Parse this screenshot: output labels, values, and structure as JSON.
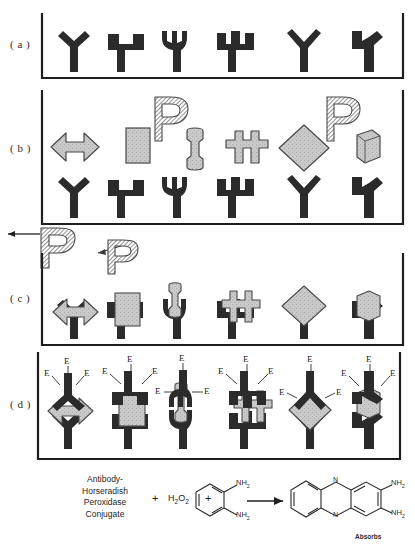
{
  "figure": {
    "panels": [
      {
        "id": "a",
        "label": "( a )",
        "caption": "Capture antibodies immobilized on solid phase"
      },
      {
        "id": "b",
        "label": "( b )",
        "caption": "Antigens added above immobilized capture antibodies"
      },
      {
        "id": "c",
        "label": "( c )",
        "caption": "Antigens bound to capture antibodies, unbound washed away"
      },
      {
        "id": "d",
        "label": "( d )",
        "caption": "Enzyme-labelled detection antibodies bound to captured antigens"
      }
    ],
    "antibody_shapes": [
      "y-thick",
      "square-u",
      "narrow-u",
      "trident",
      "thin-y",
      "wide-y"
    ],
    "antigen_shapes": [
      "double-arrow",
      "rectangle",
      "dumbbell",
      "cross",
      "diamond",
      "hexagon"
    ],
    "unbound_antigen_glyph": "P",
    "unbound_antigen_count": 2,
    "enzyme_label": "E",
    "enzyme_labels_per_complex": 3,
    "colors": {
      "antibody": "#2b2b2b",
      "antigen": "#c6c6c6",
      "antigen_edge": "#4a4a4a",
      "baseline": "#1f1f1f",
      "background": "#ffffff"
    }
  },
  "equation": {
    "reactant1_lines": [
      "Antibody-",
      "Horseradish",
      "Peroxidase",
      "Conjugate"
    ],
    "plus1": "+",
    "reactant2": "H2O2",
    "reactant2_parts": {
      "h": "H",
      "h_sub": "2",
      "o": "O",
      "o_sub": "2"
    },
    "plus2": "+",
    "reactant3_name": "o-phenylenediamine",
    "reactant3_groups": [
      "NH2",
      "NH2"
    ],
    "arrow": "→",
    "product_name": "2,3-diaminophenazine",
    "product_groups": [
      "NH2",
      "NH2"
    ],
    "product_heteroatoms": [
      "N",
      "N"
    ],
    "amine_text": "NH",
    "amine_sub": "2",
    "nitrogen_text": "N",
    "absorbs_label": "Absorbs"
  }
}
